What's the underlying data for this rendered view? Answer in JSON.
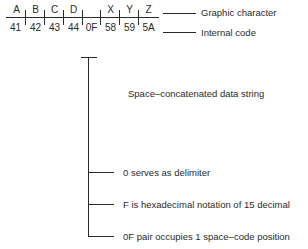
{
  "table": {
    "graphic_characters": [
      "A",
      "B",
      "C",
      "D",
      "",
      "X",
      "Y",
      "Z"
    ],
    "internal_codes": [
      "41",
      "42",
      "43",
      "44",
      "0F",
      "58",
      "59",
      "5A"
    ]
  },
  "legend": {
    "graphic_label": "Graphic character",
    "internal_label": "Internal code"
  },
  "bracket": {
    "title": "Space–concatenated data string",
    "notes": [
      "0 serves as delimiter",
      "F is hexadecimal notation of 15 decimal",
      "0F pair occupies 1 space–code position"
    ]
  }
}
